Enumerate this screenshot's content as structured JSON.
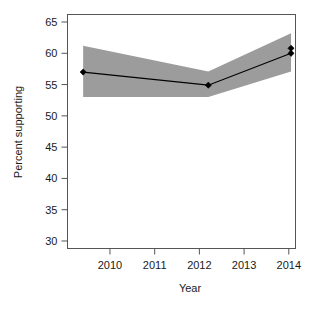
{
  "chart_data": {
    "type": "line",
    "title": "",
    "xlabel": "Year",
    "ylabel": "Percent supporting",
    "xlim": [
      2009.05,
      2014.15
    ],
    "ylim": [
      28.8,
      66.2
    ],
    "xticks": [
      2010,
      2011,
      2012,
      2013,
      2014
    ],
    "xtick_labels": [
      "2010",
      "2011",
      "2012",
      "2013",
      "2014"
    ],
    "yticks": [
      30,
      35,
      40,
      45,
      50,
      55,
      60,
      65
    ],
    "ytick_labels": [
      "30",
      "35",
      "40",
      "45",
      "50",
      "55",
      "60",
      "65"
    ],
    "grid": false,
    "legend": null,
    "series": [
      {
        "name": "Percent supporting",
        "type": "line",
        "color": "#000000",
        "marker": "diamond",
        "x": [
          2009.4,
          2012.2,
          2014.05
        ],
        "values": [
          57.0,
          54.9,
          60.0
        ]
      },
      {
        "name": "Confidence band",
        "type": "area",
        "color": "#9c9c9c",
        "x": [
          2009.4,
          2012.2,
          2014.05
        ],
        "upper": [
          61.2,
          57.1,
          63.2
        ],
        "lower": [
          53.0,
          53.0,
          57.1
        ]
      }
    ],
    "extra_points": [
      {
        "x": 2014.05,
        "y": 60.8,
        "marker": "diamond",
        "color": "#000000"
      }
    ],
    "annotations": []
  },
  "axis": {
    "x_title": "Year",
    "y_title": "Percent supporting"
  },
  "colors": {
    "band": "#9c9c9c",
    "line": "#000000",
    "axis": "#555555",
    "background": "#ffffff"
  }
}
